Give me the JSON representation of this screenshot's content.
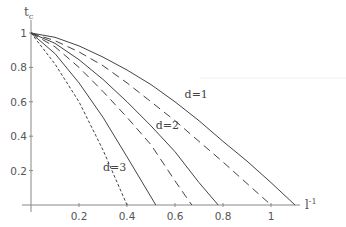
{
  "chart_data": {
    "type": "line",
    "title": "",
    "xlabel": "l^-1",
    "ylabel": "t_c",
    "xlim": [
      0,
      1.2
    ],
    "ylim": [
      0,
      1.0
    ],
    "x_ticks": [
      0.2,
      0.4,
      0.6,
      0.8,
      1.0
    ],
    "x_tick_labels": [
      "0.2",
      "0.4",
      "0.6",
      "0.8",
      "1"
    ],
    "y_ticks": [
      0.2,
      0.4,
      0.6,
      0.8,
      1.0
    ],
    "y_tick_labels": [
      "0.2",
      "0.4",
      "0.6",
      "0.8",
      "1"
    ],
    "grid": false,
    "legend": "inline labels",
    "series": [
      {
        "name": "d=1 solid",
        "style": "solid",
        "x": [
          0,
          0.1,
          0.2,
          0.3,
          0.4,
          0.5,
          0.6,
          0.7,
          0.8,
          0.9,
          1.0,
          1.1
        ],
        "values": [
          1.0,
          0.975,
          0.925,
          0.86,
          0.785,
          0.7,
          0.6,
          0.49,
          0.37,
          0.255,
          0.13,
          0.0
        ]
      },
      {
        "name": "d=1 dashed",
        "style": "dashed",
        "x": [
          0,
          0.1,
          0.2,
          0.3,
          0.4,
          0.5,
          0.6,
          0.7,
          0.8,
          0.9,
          1.0
        ],
        "values": [
          1.0,
          0.955,
          0.89,
          0.81,
          0.71,
          0.6,
          0.49,
          0.37,
          0.25,
          0.125,
          0.0
        ]
      },
      {
        "name": "d=2 solid",
        "style": "solid",
        "x": [
          0,
          0.1,
          0.2,
          0.3,
          0.4,
          0.5,
          0.6,
          0.7,
          0.78
        ],
        "values": [
          1.0,
          0.94,
          0.845,
          0.73,
          0.6,
          0.46,
          0.31,
          0.13,
          0.0
        ]
      },
      {
        "name": "d=2 dashed",
        "style": "dashed",
        "x": [
          0,
          0.1,
          0.2,
          0.3,
          0.4,
          0.5,
          0.6,
          0.67
        ],
        "values": [
          1.0,
          0.92,
          0.8,
          0.66,
          0.51,
          0.35,
          0.14,
          0.0
        ]
      },
      {
        "name": "d=3 solid",
        "style": "solid",
        "x": [
          0,
          0.1,
          0.2,
          0.3,
          0.4,
          0.52
        ],
        "values": [
          1.0,
          0.88,
          0.71,
          0.51,
          0.28,
          0.0
        ]
      },
      {
        "name": "d=3 dashed",
        "style": "dashed",
        "x": [
          0,
          0.1,
          0.2,
          0.3,
          0.4
        ],
        "values": [
          1.0,
          0.82,
          0.6,
          0.32,
          0.0
        ]
      }
    ],
    "annotations": [
      {
        "text": "d=1",
        "x": 0.64,
        "y": 0.62
      },
      {
        "text": "d=2",
        "x": 0.52,
        "y": 0.44
      },
      {
        "text": "d=3",
        "x": 0.3,
        "y": 0.2
      }
    ]
  },
  "axes": {
    "y_title": "t",
    "y_title_sub": "c",
    "x_title": "l",
    "x_title_sup": "-1"
  }
}
